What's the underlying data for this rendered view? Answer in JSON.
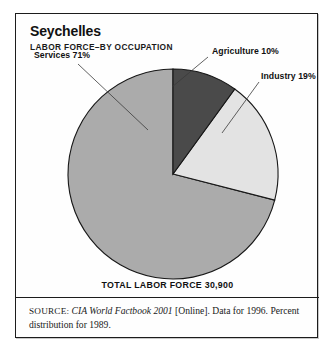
{
  "figure": {
    "title": "Seychelles",
    "subtitle": "LABOR FORCE–BY OCCUPATION",
    "total_line": "TOTAL LABOR FORCE 30,900"
  },
  "source": {
    "label": "SOURCE:",
    "work": "CIA World Factbook 2001",
    "rest": " [Online]. Data for 1996. Percent distribution for 1989."
  },
  "labels": {
    "services": "Services 71%",
    "agriculture": "Agriculture 10%",
    "industry": "Industry 19%"
  },
  "colors": {
    "agriculture": "#4a4a4a",
    "industry": "#e3e3e3",
    "services": "#ababab",
    "outline": "#171717",
    "frame": "#1c1c1c",
    "text": "#101010"
  },
  "chart_data": {
    "type": "pie",
    "title": "Seychelles",
    "subtitle": "LABOR FORCE–BY OCCUPATION",
    "categories": [
      "Agriculture",
      "Industry",
      "Services"
    ],
    "values": [
      10,
      19,
      71
    ],
    "unit": "percent",
    "labels": [
      "Agriculture 10%",
      "Industry 19%",
      "Services 71%"
    ],
    "slice_colors": [
      "#4a4a4a",
      "#e3e3e3",
      "#ababab"
    ],
    "start_angle_deg": 0,
    "direction": "clockwise",
    "total_label": "TOTAL LABOR FORCE 30,900",
    "total_value": 30900,
    "legend": "none-inline-labels-with-leader-lines",
    "grid": false,
    "annotations": [
      "SOURCE: CIA World Factbook 2001 [Online]. Data for 1996.",
      "Percent distribution for 1989."
    ]
  }
}
